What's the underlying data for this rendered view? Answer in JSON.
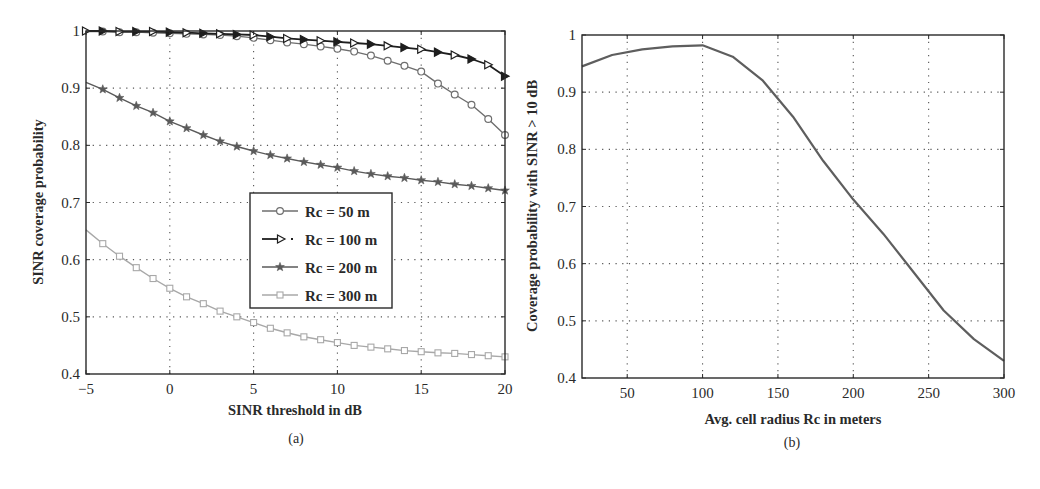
{
  "figure": {
    "panels": [
      {
        "caption": "(a)",
        "xlabel": "SINR threshold in dB",
        "ylabel": "SINR coverage probability",
        "xticks": [
          "-5",
          "0",
          "5",
          "10",
          "15",
          "20"
        ],
        "yticks": [
          "0.4",
          "0.5",
          "0.6",
          "0.7",
          "0.8",
          "0.9",
          "1"
        ]
      },
      {
        "caption": "(b)",
        "xlabel": "Avg. cell radius Rc in meters",
        "ylabel": "Coverage probability with SINR > 10 dB",
        "xticks": [
          "50",
          "100",
          "150",
          "200",
          "250",
          "300"
        ],
        "yticks": [
          "0.4",
          "0.5",
          "0.6",
          "0.7",
          "0.8",
          "0.9",
          "1"
        ]
      }
    ],
    "legend": [
      "Rc = 50 m",
      "Rc = 100 m",
      "Rc = 200 m",
      "Rc = 300 m"
    ],
    "colors": {
      "axis": "#2a2a2a",
      "grid": "#555555",
      "rc50": "#6e6e6e",
      "rc100": "#1e1e1e",
      "rc200": "#5a5a5a",
      "rc300": "#a8a8a8",
      "curve_b": "#5e5e5e"
    }
  },
  "chart_data": [
    {
      "type": "line",
      "title": "",
      "caption": "(a)",
      "xlabel": "SINR threshold in dB",
      "ylabel": "SINR coverage probability",
      "xlim": [
        -5,
        20
      ],
      "ylim": [
        0.4,
        1.0
      ],
      "grid": true,
      "legend_position": "center",
      "x": [
        -5,
        -4,
        -3,
        -2,
        -1,
        0,
        1,
        2,
        3,
        4,
        5,
        6,
        7,
        8,
        9,
        10,
        11,
        12,
        13,
        14,
        15,
        16,
        17,
        18,
        19,
        20
      ],
      "series": [
        {
          "name": "Rc = 50 m",
          "marker": "circle",
          "values": [
            0.999,
            0.999,
            0.998,
            0.998,
            0.997,
            0.996,
            0.995,
            0.994,
            0.993,
            0.991,
            0.988,
            0.984,
            0.98,
            0.977,
            0.973,
            0.969,
            0.964,
            0.957,
            0.948,
            0.939,
            0.929,
            0.908,
            0.889,
            0.871,
            0.846,
            0.818
          ]
        },
        {
          "name": "Rc = 100 m",
          "marker": "triangle-right",
          "values": [
            1.0,
            1.0,
            0.999,
            0.999,
            0.999,
            0.998,
            0.997,
            0.996,
            0.995,
            0.994,
            0.993,
            0.99,
            0.987,
            0.985,
            0.983,
            0.981,
            0.979,
            0.977,
            0.974,
            0.971,
            0.968,
            0.963,
            0.958,
            0.951,
            0.941,
            0.921
          ]
        },
        {
          "name": "Rc = 200 m",
          "marker": "star",
          "values": [
            0.91,
            0.898,
            0.883,
            0.869,
            0.857,
            0.842,
            0.83,
            0.818,
            0.807,
            0.798,
            0.79,
            0.783,
            0.777,
            0.771,
            0.766,
            0.761,
            0.755,
            0.75,
            0.746,
            0.743,
            0.739,
            0.736,
            0.732,
            0.729,
            0.725,
            0.721
          ]
        },
        {
          "name": "Rc = 300 m",
          "marker": "square",
          "values": [
            0.652,
            0.628,
            0.606,
            0.586,
            0.567,
            0.55,
            0.535,
            0.523,
            0.51,
            0.5,
            0.49,
            0.48,
            0.472,
            0.465,
            0.46,
            0.455,
            0.45,
            0.447,
            0.444,
            0.441,
            0.439,
            0.437,
            0.436,
            0.434,
            0.432,
            0.43
          ]
        }
      ]
    },
    {
      "type": "line",
      "title": "",
      "caption": "(b)",
      "xlabel": "Avg. cell radius Rc in meters",
      "ylabel": "Coverage probability with SINR > 10 dB",
      "xlim": [
        20,
        300
      ],
      "ylim": [
        0.4,
        1.0
      ],
      "grid": true,
      "x": [
        20,
        40,
        60,
        80,
        100,
        120,
        140,
        160,
        180,
        200,
        220,
        240,
        260,
        280,
        300
      ],
      "series": [
        {
          "name": "Coverage probability",
          "values": [
            0.945,
            0.965,
            0.975,
            0.98,
            0.982,
            0.962,
            0.92,
            0.857,
            0.78,
            0.712,
            0.652,
            0.585,
            0.518,
            0.468,
            0.43
          ]
        }
      ]
    }
  ]
}
